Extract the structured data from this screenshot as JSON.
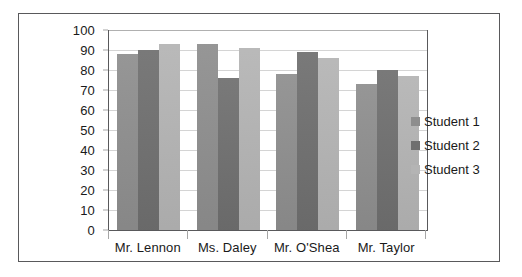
{
  "chart_data": {
    "type": "bar",
    "title": "",
    "xlabel": "",
    "ylabel": "",
    "ylim": [
      0,
      100
    ],
    "ytick_step": 10,
    "yticks": [
      100,
      90,
      80,
      70,
      60,
      50,
      40,
      30,
      20,
      10,
      0
    ],
    "grid": true,
    "legend_position": "right",
    "categories": [
      "Mr. Lennon",
      "Ms. Daley",
      "Mr. O'Shea",
      "Mr. Taylor"
    ],
    "series": [
      {
        "name": "Student 1",
        "color": "#8e8e8e",
        "values": [
          88,
          93,
          78,
          73
        ]
      },
      {
        "name": "Student 2",
        "color": "#6f6f6f",
        "values": [
          90,
          76,
          89,
          80
        ]
      },
      {
        "name": "Student 3",
        "color": "#b4b4b4",
        "values": [
          93,
          91,
          86,
          77
        ]
      }
    ]
  },
  "colors": {
    "series_1": "#8e8e8e",
    "series_2": "#6f6f6f",
    "series_3": "#b4b4b4",
    "axis": "#59595b",
    "gridline": "#d4d4d4",
    "text": "#1a1a1a",
    "background": "#ffffff"
  }
}
